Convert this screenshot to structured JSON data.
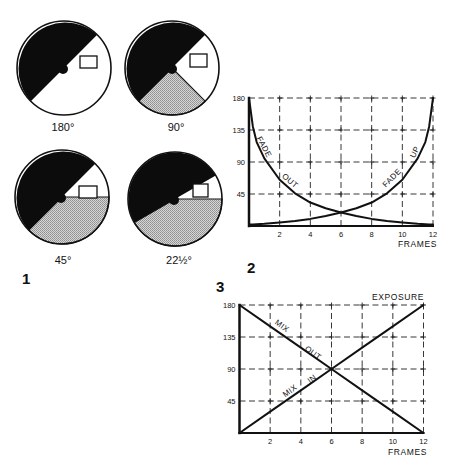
{
  "figure": {
    "panel_labels": {
      "panel_1": "1",
      "panel_2": "2",
      "panel_3": "3"
    },
    "shutter_diagrams": [
      {
        "label": "180°",
        "opening_deg": 180
      },
      {
        "label": "90°",
        "opening_deg": 90
      },
      {
        "label": "45°",
        "opening_deg": 45
      },
      {
        "label": "22½°",
        "opening_deg": 22.5
      }
    ],
    "colors": {
      "ink": "#111111",
      "blade": "#0c0c0c",
      "shade": "#b6b6b6",
      "paper": "#ffffff"
    }
  },
  "chart_data": [
    {
      "panel": "2",
      "type": "line",
      "title": "",
      "xlabel": "FRAMES",
      "ylabel": "",
      "xlim": [
        0,
        12
      ],
      "ylim": [
        0,
        180
      ],
      "xticks": [
        2,
        4,
        6,
        8,
        10,
        12
      ],
      "yticks": [
        45,
        90,
        135,
        180
      ],
      "grid": true,
      "legend": "none (labels written along curves)",
      "x": [
        0,
        0.25,
        0.5,
        1,
        2,
        3,
        4,
        5,
        6,
        7,
        8,
        9,
        10,
        11,
        11.5,
        11.75,
        12
      ],
      "series": [
        {
          "name": "FADE OUT",
          "values": [
            180,
            140,
            118,
            95,
            65,
            46,
            33,
            25,
            19,
            14,
            10,
            7,
            5,
            3,
            2.5,
            2.2,
            2
          ]
        },
        {
          "name": "FADE UP",
          "values": [
            2,
            2.2,
            2.5,
            3,
            5,
            7,
            10,
            14,
            19,
            25,
            33,
            46,
            65,
            95,
            118,
            140,
            180
          ]
        }
      ],
      "annotations": [
        {
          "text": "FADE",
          "series": "FADE OUT"
        },
        {
          "text": "OUT",
          "series": "FADE OUT"
        },
        {
          "text": "FADE",
          "series": "FADE UP"
        },
        {
          "text": "UP",
          "series": "FADE UP"
        }
      ]
    },
    {
      "panel": "3",
      "type": "line",
      "title": "EXPOSURE",
      "xlabel": "FRAMES",
      "ylabel": "",
      "xlim": [
        0,
        12
      ],
      "ylim": [
        0,
        180
      ],
      "xticks": [
        2,
        4,
        6,
        8,
        10,
        12
      ],
      "yticks": [
        45,
        90,
        135,
        180
      ],
      "grid": true,
      "legend": "none (labels written along lines)",
      "x": [
        0,
        2,
        4,
        6,
        8,
        10,
        12
      ],
      "series": [
        {
          "name": "MIX OUT",
          "values": [
            180,
            150,
            120,
            90,
            60,
            30,
            0
          ]
        },
        {
          "name": "MIX IN",
          "values": [
            0,
            30,
            60,
            90,
            120,
            150,
            180
          ]
        }
      ],
      "annotations": [
        {
          "text": "MIX",
          "series": "MIX OUT"
        },
        {
          "text": "OUT",
          "series": "MIX OUT"
        },
        {
          "text": "MIX",
          "series": "MIX IN"
        },
        {
          "text": "IN",
          "series": "MIX IN"
        }
      ]
    }
  ]
}
